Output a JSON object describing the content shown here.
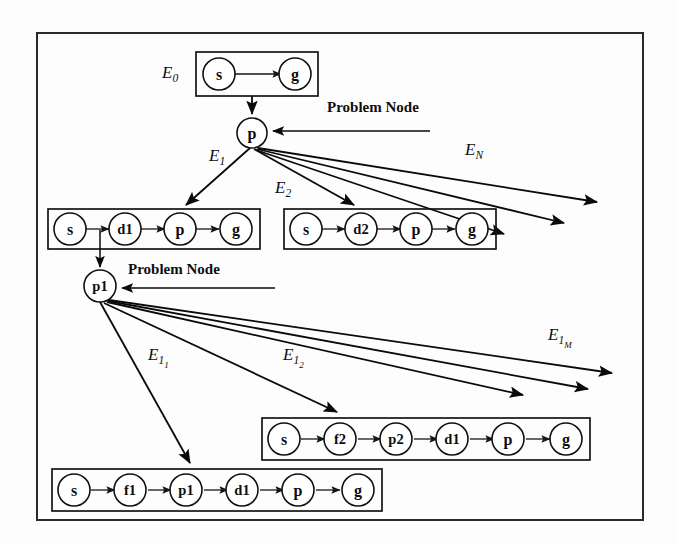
{
  "figure": {
    "type": "tree-diagram",
    "title": "",
    "frame": {
      "x": 37,
      "y": 33,
      "width": 606,
      "height": 487
    }
  },
  "annotations": [
    {
      "id": "pn-top",
      "text": "Problem Node",
      "x": 327,
      "y": 112
    },
    {
      "id": "pn-mid",
      "text": "Problem Node",
      "x": 128,
      "y": 274
    }
  ],
  "edge_labels": [
    {
      "id": "E0",
      "base": "E",
      "sub": "0",
      "subsub": "",
      "x": 162,
      "y": 78
    },
    {
      "id": "E1",
      "base": "E",
      "sub": "1",
      "subsub": "",
      "x": 209,
      "y": 161
    },
    {
      "id": "E2",
      "base": "E",
      "sub": "2",
      "subsub": "",
      "x": 275,
      "y": 193
    },
    {
      "id": "EN",
      "base": "E",
      "sub": "N",
      "subsub": "",
      "x": 465,
      "y": 155
    },
    {
      "id": "E11",
      "base": "E",
      "sub": "1",
      "subsub": "1",
      "x": 148,
      "y": 360
    },
    {
      "id": "E12",
      "base": "E",
      "sub": "1",
      "subsub": "2",
      "x": 283,
      "y": 360
    },
    {
      "id": "E1M",
      "base": "E",
      "sub": "1",
      "subsub": "M",
      "x": 548,
      "y": 340
    }
  ],
  "problem_nodes": [
    {
      "id": "p",
      "label": "p",
      "cx": 252,
      "cy": 133,
      "r": 15
    },
    {
      "id": "p1",
      "label": "p1",
      "cx": 100,
      "cy": 286,
      "r": 16
    }
  ],
  "plan_boxes": [
    {
      "id": "E0-box",
      "label_ref": "E0",
      "x": 196,
      "y": 52,
      "width": 122,
      "height": 44,
      "nodes": [
        "s",
        "g"
      ]
    },
    {
      "id": "E1-box",
      "label_ref": "E1",
      "x": 48,
      "y": 209,
      "width": 212,
      "height": 40,
      "nodes": [
        "s",
        "d1",
        "p",
        "g"
      ]
    },
    {
      "id": "E2-box",
      "label_ref": "E2",
      "x": 284,
      "y": 209,
      "width": 212,
      "height": 40,
      "nodes": [
        "s",
        "d2",
        "p",
        "g"
      ]
    },
    {
      "id": "E12-box",
      "label_ref": "E12",
      "x": 262,
      "y": 418,
      "width": 328,
      "height": 42,
      "nodes": [
        "s",
        "f2",
        "p2",
        "d1",
        "p",
        "g"
      ]
    },
    {
      "id": "E11-box",
      "label_ref": "E11",
      "x": 52,
      "y": 469,
      "width": 330,
      "height": 42,
      "nodes": [
        "s",
        "f1",
        "p1",
        "d1",
        "p",
        "g"
      ]
    }
  ],
  "fan_out_counts": {
    "from_p": 5,
    "from_p1": 5
  }
}
